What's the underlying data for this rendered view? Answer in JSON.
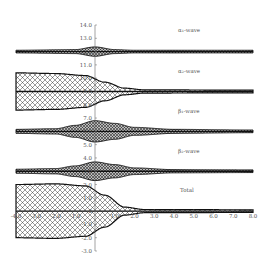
{
  "chart_data": {
    "type": "area",
    "title": "",
    "xlabel": "",
    "ylabel": "",
    "xlim": [
      -4.0,
      8.0
    ],
    "ylim": [
      -3.0,
      14.0
    ],
    "x_ticks": [
      "-4.0",
      "-3.0",
      "-2.0",
      "-1.0",
      "0",
      "1.0",
      "2.0",
      "3.0",
      "4.0",
      "5.0",
      "6.0",
      "7.0",
      "8.0"
    ],
    "y_ticks": [
      "14.0",
      "13.0",
      "12.0",
      "11.0",
      "10.0",
      "9.0",
      "8.0",
      "7.0",
      "6.0",
      "5.0",
      "4.0",
      "3.0",
      "2.0",
      "1.0",
      "0",
      "-1.0",
      "-2.0",
      "-3.0"
    ],
    "grid": false,
    "legend": "inline labels at right of y-axis",
    "series": [
      {
        "name": "α1-wave",
        "label": "α₁-wave",
        "baseline": 12.0,
        "envelope": {
          "x": [
            -4.0,
            -1.0,
            0.0,
            1.0,
            2.0,
            8.0
          ],
          "half_width": [
            0.1,
            0.15,
            0.35,
            0.15,
            0.1,
            0.1
          ]
        }
      },
      {
        "name": "α2-wave",
        "label": "α₂-wave",
        "baseline": 9.0,
        "envelope": {
          "x": [
            -4.0,
            -2.0,
            -0.5,
            0.5,
            1.5,
            2.5,
            8.0
          ],
          "half_width": [
            1.4,
            1.35,
            1.2,
            0.7,
            0.25,
            0.12,
            0.1
          ]
        }
      },
      {
        "name": "β1-wave",
        "label": "β₁-wave",
        "baseline": 6.0,
        "envelope": {
          "x": [
            -4.0,
            -2.0,
            -1.0,
            0.0,
            1.0,
            2.0,
            4.0,
            8.0
          ],
          "half_width": [
            0.15,
            0.2,
            0.45,
            0.8,
            0.6,
            0.3,
            0.15,
            0.1
          ]
        }
      },
      {
        "name": "β2-wave",
        "label": "β₂-wave",
        "baseline": 3.0,
        "envelope": {
          "x": [
            -4.0,
            -2.0,
            -1.0,
            0.0,
            1.0,
            2.0,
            4.0,
            8.0
          ],
          "half_width": [
            0.15,
            0.2,
            0.4,
            0.7,
            0.5,
            0.25,
            0.12,
            0.1
          ]
        }
      },
      {
        "name": "Total",
        "label": "Total",
        "baseline": 0.0,
        "envelope": {
          "x": [
            -4.0,
            -2.0,
            -0.5,
            0.5,
            1.5,
            2.5,
            8.0
          ],
          "half_width": [
            2.0,
            2.05,
            1.9,
            1.2,
            0.3,
            0.12,
            0.1
          ]
        }
      }
    ]
  },
  "labels": {
    "alpha1": "α₁-wave",
    "alpha2": "α₂-wave",
    "beta1": "β₁-wave",
    "beta2": "β₂-wave",
    "total": "Total"
  },
  "axis": {
    "y_ticks": [
      "14.0",
      "13.0",
      "12.0",
      "11.0",
      "10.0",
      "9.0",
      "8.0",
      "7.0",
      "6.0",
      "5.0",
      "4.0",
      "3.0",
      "2.0",
      "1.0",
      "0",
      "-1.0",
      "-2.0",
      "-3.0"
    ],
    "x_ticks": [
      "-4.0",
      "-3.0",
      "-2.0",
      "-1.0",
      "0",
      "1.0",
      "2.0",
      "3.0",
      "4.0",
      "5.0",
      "6.0",
      "7.0",
      "8.0"
    ]
  }
}
